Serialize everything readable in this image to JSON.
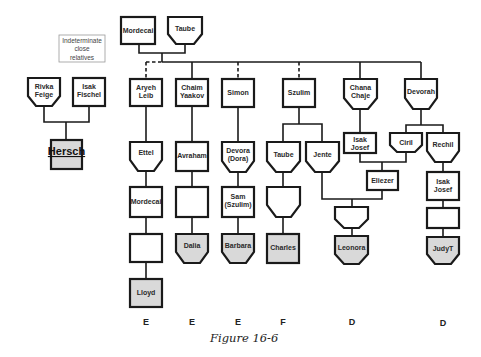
{
  "figure": {
    "caption": "Figure 16-6",
    "legend": [
      "Indeterminate",
      "close",
      "relatives"
    ],
    "colors": {
      "line": "#1a1a1a",
      "shaded": "#d9d9d9",
      "background": "#ffffff"
    }
  },
  "people": {
    "mordecai_top": [
      "Mordecai"
    ],
    "taube_top": [
      "Taube"
    ],
    "rivka_feige": [
      "Rivka",
      "Feige"
    ],
    "isak_fischel": [
      "Isak",
      "Fischel"
    ],
    "hersch": [
      "Hersch"
    ],
    "aryeh_leib": [
      "Aryeh",
      "Leib"
    ],
    "chaim_yaakov": [
      "Chaim",
      "Yaakov"
    ],
    "simon": [
      "Simon"
    ],
    "szulim": [
      "Szulim"
    ],
    "chana_chaje": [
      "Chana",
      "Chaje"
    ],
    "devorah": [
      "Devorah"
    ],
    "ettel": [
      "Ettel"
    ],
    "avraham": [
      "Avraham"
    ],
    "devora_dora": [
      "Devora",
      "(Dora)"
    ],
    "taube_2": [
      "Taube"
    ],
    "jente": [
      "Jente"
    ],
    "isak_josef_1": [
      "Isak",
      "Josef"
    ],
    "ciril": [
      "Ciril"
    ],
    "rechil": [
      "Rechil"
    ],
    "eliezer": [
      "Eliezer"
    ],
    "isak_josef_2": [
      "Isak",
      "Josef"
    ],
    "mordecai_gen3": [
      "Mordecai"
    ],
    "sam_szulim": [
      "Sam",
      "(Szulim)"
    ],
    "lloyd": [
      "Lloyd"
    ],
    "dalia": [
      "Dalia"
    ],
    "barbara": [
      "Barbara"
    ],
    "charles": [
      "Charles"
    ],
    "leonora": [
      "Leonora"
    ],
    "judyt": [
      "JudyT"
    ]
  },
  "generation_labels": [
    {
      "x": 146,
      "label": "E"
    },
    {
      "x": 192,
      "label": "E"
    },
    {
      "x": 238,
      "label": "E"
    },
    {
      "x": 283,
      "label": "F"
    },
    {
      "x": 352,
      "label": "D"
    },
    {
      "x": 443,
      "label": "D"
    }
  ]
}
